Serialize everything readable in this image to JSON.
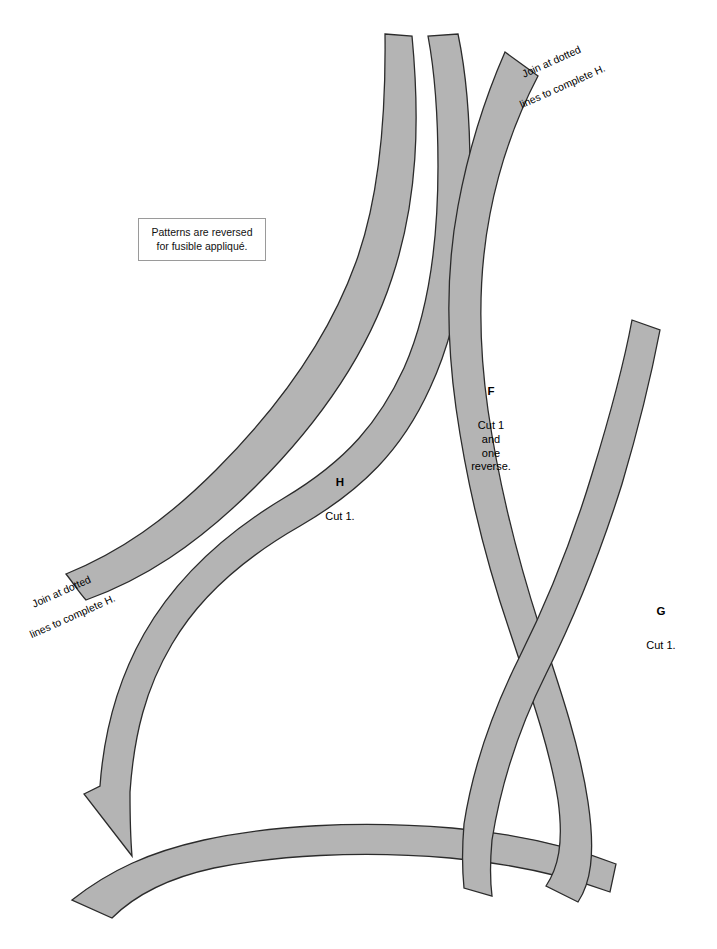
{
  "document": {
    "title": "Appliqué pattern sheet",
    "background_color": "#ffffff"
  },
  "note_box": {
    "text": "Patterns are reversed for fusible appliqué.",
    "line1": "Patterns are reversed",
    "line2": "for fusible appliqué.",
    "border_color": "#9a9a9a"
  },
  "join_notes": [
    {
      "id": "top",
      "line1": "Join at dotted",
      "line2": "lines to complete H.",
      "rotation_degrees": -24
    },
    {
      "id": "bottom",
      "line1": "Join at dotted",
      "line2": "lines to complete H.",
      "rotation_degrees": -24
    }
  ],
  "pieces": [
    {
      "id": "H",
      "letter": "H",
      "cut_text": "Cut 1.",
      "fill_color": "#b4b4b4",
      "stroke_color": "#2b2b2b"
    },
    {
      "id": "F",
      "letter": "F",
      "cut_text": "Cut 1\nand\none\nreverse.",
      "fill_color": "#b4b4b4",
      "stroke_color": "#2b2b2b"
    },
    {
      "id": "G",
      "letter": "G",
      "cut_text": "Cut 1.",
      "fill_color": "#b4b4b4",
      "stroke_color": "#2b2b2b"
    }
  ],
  "shapes": {
    "fill": "#b4b4b4",
    "stroke": "#2b2b2b",
    "stroke_width": 1.3,
    "paths": {
      "h_upper_strip": "M 385 34 L 412 36 C 420 120 418 200 392 278 C 368 352 322 420 256 486 C 196 546 142 580 86 600 C 78 591 74 584 66 574 C 120 552 166 520 216 470 C 282 404 330 334 356 262 C 380 196 386 116 385 34 Z",
      "h_lower_strip": "M 84 794 L 100 786 C 104 730 118 680 144 634 C 176 578 224 534 284 498 C 348 460 380 420 404 368 C 428 314 438 244 438 166 C 438 110 434 68 428 36 L 458 34 C 466 72 470 116 470 170 C 470 252 458 328 430 388 C 402 450 362 490 300 526 C 244 558 200 596 172 644 C 146 688 134 734 130 792 C 130 810 130 832 132 856 Z",
      "h_bottom_tail": "M 72 900 C 110 870 150 852 204 840 C 268 826 356 820 452 828 C 520 834 570 846 616 864 L 610 892 C 566 876 516 864 450 858 C 358 850 274 856 214 868 C 168 878 136 894 112 918 Z",
      "f_strip": "M 505 52 L 538 76 C 516 118 500 162 490 214 C 478 276 478 340 488 410 C 500 492 518 560 540 628 C 562 694 580 748 588 802 C 596 856 590 884 578 902 L 546 886 C 558 868 564 844 558 800 C 550 750 532 698 510 632 C 486 562 468 492 456 408 C 446 336 446 270 458 206 C 468 152 484 100 505 52 Z",
      "g_strip": "M 632 320 L 660 330 C 650 382 638 430 622 484 C 600 554 574 618 546 674 C 516 734 500 790 492 840 C 490 862 490 880 492 896 L 464 888 C 462 868 462 848 464 824 C 472 772 490 716 520 656 C 548 600 572 540 592 474 C 608 422 622 374 632 320 Z"
    }
  }
}
